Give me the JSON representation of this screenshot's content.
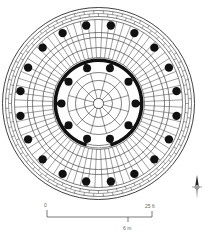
{
  "diagram": {
    "type": "architectural-floor-plan",
    "center": [
      98.5,
      103.5
    ],
    "stroke_color": "#2a2a2a",
    "fill_color": "#111111",
    "outer": {
      "rings": [
        96,
        93,
        87,
        84
      ],
      "brick_band": {
        "inner": 87,
        "outer": 93,
        "courses": 2
      },
      "column_band": {
        "inner": 71,
        "outer": 84
      },
      "columns": {
        "count": 20,
        "radius": 79,
        "size": 4.2,
        "offset_deg": 9
      },
      "radial_lines": 72
    },
    "middle": {
      "rings": [
        71,
        66,
        56,
        46
      ],
      "radial_lines": 72
    },
    "inner_wall": {
      "radius_outer": 45,
      "radius_inner": 41.5,
      "opening_deg": [
        -106,
        -74
      ],
      "columns": {
        "count": 10,
        "radius": 37,
        "size": 4,
        "offset_deg": 18
      }
    },
    "core": {
      "rings": [
        31,
        23,
        14,
        5
      ],
      "radial_lines": 12
    }
  },
  "scale_bar": {
    "zero_label": "0",
    "end_label": "25 ft",
    "metric_label": "6 m"
  },
  "north_arrow": {
    "icon": "compass-north-arrow"
  }
}
